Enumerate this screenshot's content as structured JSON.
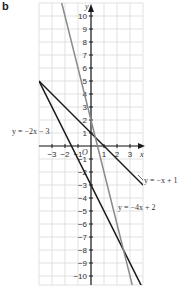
{
  "panel_label": "b",
  "chart_data": {
    "type": "line",
    "title": "",
    "xlabel": "x",
    "ylabel": "y",
    "origin_label": "O",
    "xlim": [
      -4,
      4
    ],
    "ylim": [
      -11,
      11
    ],
    "grid": true,
    "x_ticks": [
      -3,
      -2,
      -1,
      1,
      2,
      3
    ],
    "x_tick_labels": [
      "−3",
      "−2",
      "−1",
      "1",
      "2",
      "3"
    ],
    "y_ticks": [
      10,
      9,
      8,
      7,
      6,
      5,
      4,
      3,
      2,
      1,
      -1,
      -2,
      -3,
      -4,
      -5,
      -6,
      -7,
      -8,
      -9,
      -10
    ],
    "y_tick_labels": [
      "10",
      "9",
      "8",
      "7",
      "6",
      "5",
      "4",
      "3",
      "2",
      "1",
      "−1",
      "−2",
      "−3",
      "−4",
      "−5",
      "−6",
      "−7",
      "−8",
      "−9",
      "−10"
    ],
    "series": [
      {
        "name": "y = −2x − 3",
        "slope": -2,
        "intercept": -3,
        "color": "#1a1a1a",
        "x": [
          -4,
          4
        ],
        "y": [
          5,
          -11
        ]
      },
      {
        "name": "y = −x + 1",
        "slope": -1,
        "intercept": 1,
        "color": "#1a1a1a",
        "x": [
          -4,
          4
        ],
        "y": [
          5,
          -3
        ]
      },
      {
        "name": "y = −4x + 2",
        "slope": -4,
        "intercept": 2,
        "color": "#8a8a8a",
        "x": [
          -2.25,
          3.2
        ],
        "y": [
          11,
          -10.8
        ]
      }
    ],
    "annotations": [
      {
        "text": "y = −2x − 3",
        "position": "left, near y=1"
      },
      {
        "text": "y = −x + 1",
        "position": "right, near y=−3"
      },
      {
        "text": "y = −4x + 2",
        "position": "right-center, near y=−5"
      }
    ]
  }
}
